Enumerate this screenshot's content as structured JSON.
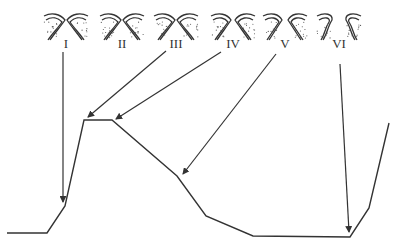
{
  "figure": {
    "stages": [
      {
        "id": "I",
        "label": "I"
      },
      {
        "id": "II",
        "label": "II"
      },
      {
        "id": "III",
        "label": "III"
      },
      {
        "id": "IV",
        "label": "IV"
      },
      {
        "id": "V",
        "label": "V"
      },
      {
        "id": "VI",
        "label": "VI"
      }
    ],
    "arrows": [
      {
        "from": "I",
        "to_segment": "rising-edge-start"
      },
      {
        "from": "III",
        "to_segment": "plateau-start"
      },
      {
        "from": "IV",
        "to_segment": "plateau-end"
      },
      {
        "from": "V",
        "to_segment": "decline-middle"
      },
      {
        "from": "VI",
        "to_segment": "trough-end"
      }
    ],
    "curve_phases": [
      "baseline",
      "rapid-rise",
      "plateau",
      "decline",
      "trough",
      "rise"
    ]
  }
}
